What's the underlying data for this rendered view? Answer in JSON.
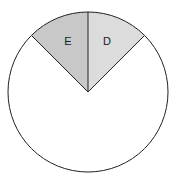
{
  "figure": {
    "width": 176,
    "height": 183,
    "background_color": "#ffffff"
  },
  "chart_data": {
    "type": "pie",
    "title": "",
    "subtitle": "",
    "xlabel": "",
    "ylabel": "",
    "grid": false,
    "legend_position": "none",
    "labels_inside_slices": true,
    "center_x": 88,
    "center_y": 92,
    "radius": 80,
    "start_angle_deg": 315,
    "total_degrees": 360,
    "outline_color": "#222222",
    "outline_width": 1,
    "categories": [
      "E",
      "D",
      ""
    ],
    "values": [
      45,
      45,
      270
    ],
    "value_unit": "degrees",
    "percentages": [
      12.5,
      12.5,
      75
    ],
    "colors": [
      "#c8c8c8",
      "#dcdcdc",
      "#ffffff"
    ],
    "slices": [
      {
        "label": "E",
        "value": 45,
        "percent": 12.5,
        "color": "#c8c8c8",
        "start_angle_deg": 315,
        "end_angle_deg": 360,
        "label_x": 68,
        "label_y": 42,
        "labeled": true
      },
      {
        "label": "D",
        "value": 45,
        "percent": 12.5,
        "color": "#dcdcdc",
        "start_angle_deg": 0,
        "end_angle_deg": 45,
        "label_x": 107,
        "label_y": 42,
        "labeled": true
      },
      {
        "label": "",
        "value": 270,
        "percent": 75,
        "color": "#ffffff",
        "start_angle_deg": 45,
        "end_angle_deg": 315,
        "label_x": 88,
        "label_y": 132,
        "labeled": false
      }
    ]
  }
}
